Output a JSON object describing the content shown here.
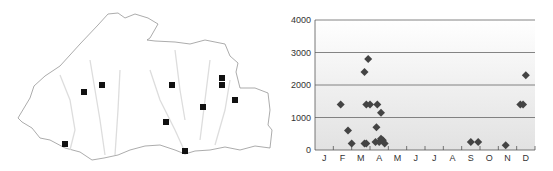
{
  "map": {
    "title": "",
    "markers": [
      {
        "x": 84,
        "y": 92
      },
      {
        "x": 102,
        "y": 85
      },
      {
        "x": 65,
        "y": 144
      },
      {
        "x": 172,
        "y": 85
      },
      {
        "x": 166,
        "y": 122
      },
      {
        "x": 185,
        "y": 151
      },
      {
        "x": 203,
        "y": 107
      },
      {
        "x": 222,
        "y": 78
      },
      {
        "x": 222,
        "y": 85
      },
      {
        "x": 235,
        "y": 100
      }
    ]
  },
  "chart_data": {
    "type": "scatter",
    "title": "",
    "xlabel": "",
    "ylabel": "",
    "categories": [
      "J",
      "F",
      "M",
      "A",
      "M",
      "J",
      "J",
      "A",
      "S",
      "O",
      "N",
      "D"
    ],
    "y_ticks": [
      0,
      1000,
      2000,
      3000,
      4000
    ],
    "ylim": [
      0,
      4000
    ],
    "grid": true,
    "points": [
      {
        "month": 1.9,
        "value": 1400
      },
      {
        "month": 2.3,
        "value": 600
      },
      {
        "month": 2.5,
        "value": 200
      },
      {
        "month": 3.2,
        "value": 2400
      },
      {
        "month": 3.4,
        "value": 2800
      },
      {
        "month": 3.3,
        "value": 1400
      },
      {
        "month": 3.5,
        "value": 1400
      },
      {
        "month": 3.2,
        "value": 200
      },
      {
        "month": 3.3,
        "value": 200
      },
      {
        "month": 3.9,
        "value": 1400
      },
      {
        "month": 4.1,
        "value": 1150
      },
      {
        "month": 3.85,
        "value": 700
      },
      {
        "month": 3.8,
        "value": 250
      },
      {
        "month": 4.0,
        "value": 250
      },
      {
        "month": 4.1,
        "value": 350
      },
      {
        "month": 4.2,
        "value": 300
      },
      {
        "month": 4.3,
        "value": 200
      },
      {
        "month": 9.0,
        "value": 250
      },
      {
        "month": 9.4,
        "value": 250
      },
      {
        "month": 10.9,
        "value": 150
      },
      {
        "month": 11.7,
        "value": 1400
      },
      {
        "month": 11.85,
        "value": 1400
      },
      {
        "month": 12.0,
        "value": 2300
      }
    ]
  }
}
